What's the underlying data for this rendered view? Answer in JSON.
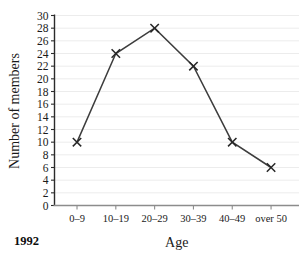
{
  "chart_data": {
    "type": "line",
    "title": "",
    "xlabel": "Age",
    "ylabel": "Number of members",
    "categories": [
      "0–9",
      "10–19",
      "20–29",
      "30–39",
      "40–49",
      "over 50"
    ],
    "values": [
      10,
      24,
      28,
      22,
      10,
      6
    ],
    "series": [
      {
        "name": "Number of members",
        "values": [
          10,
          24,
          28,
          22,
          10,
          6
        ]
      }
    ],
    "ylim": [
      0,
      30
    ],
    "ytick_step": 2,
    "yticks": [
      0,
      2,
      4,
      6,
      8,
      10,
      12,
      14,
      16,
      18,
      20,
      22,
      24,
      26,
      28,
      30
    ],
    "ytick_labels": [
      "0",
      "2",
      "4",
      "6",
      "8",
      "10",
      "12",
      "14",
      "16",
      "18",
      "20",
      "22",
      "24",
      "26",
      "28",
      "30"
    ],
    "grid": "horizontal",
    "legend": "none",
    "marker": "cross",
    "annotations": [
      {
        "name": "year-label",
        "text": "1992",
        "position": "bottom-left"
      }
    ]
  },
  "colors": {
    "line": "#3d3d3d",
    "marker": "#262626",
    "gridline": "#ececec",
    "yaxis": "#2b2b2b",
    "xaxis": "#8c8c8c",
    "text": "#1a1a1a",
    "background": "#ffffff"
  }
}
